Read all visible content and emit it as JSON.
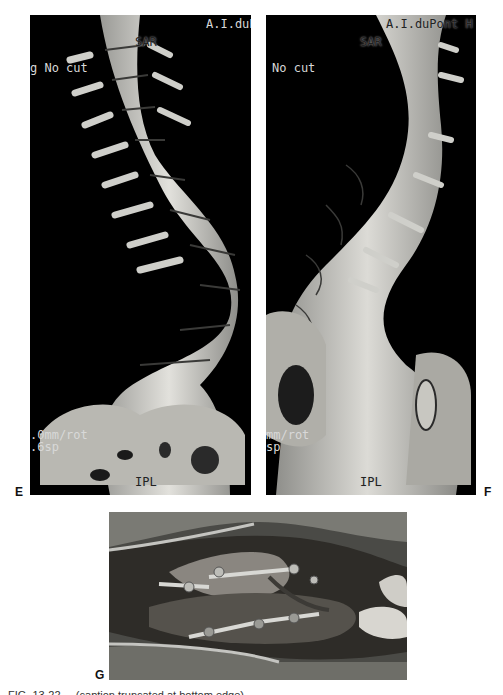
{
  "figure": {
    "panels": [
      {
        "letter": "E",
        "description": "3D CT reconstruction of scoliotic spine, posterior/anterior view",
        "overlays": {
          "top_right": "A.I.duPont H",
          "top_center": "SAR",
          "left_mid": "g  No cut",
          "bottom_left_1": ".0mm/rot",
          "bottom_left_2": ".6sp",
          "bottom_center": "IPL"
        }
      },
      {
        "letter": "F",
        "description": "3D CT reconstruction of scoliotic spine, oblique view",
        "overlays": {
          "top_right": "A.I.duPont H",
          "top_center": "SAR",
          "left_mid": "No cut",
          "bottom_left_1": "mm/rot",
          "bottom_left_2": "sp",
          "bottom_center": "IPL"
        }
      },
      {
        "letter": "G",
        "description": "Intraoperative photograph showing posterior instrumentation with rods and screws"
      }
    ],
    "caption_partial": "FIG. 13-22 ... (caption truncated at bottom edge)"
  }
}
